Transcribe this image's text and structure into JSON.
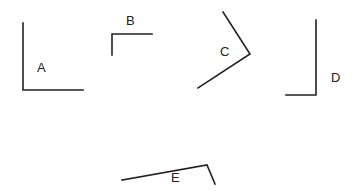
{
  "diagram": {
    "title": "",
    "line_color": "#222222",
    "background": "#ffffff",
    "angles": [
      {
        "label": "A",
        "vertex": [
          23,
          90
        ],
        "ray1_end": [
          23,
          23
        ],
        "ray2_end": [
          83,
          90
        ],
        "label_pos": [
          37,
          72
        ],
        "description": "right angle, rays up and right"
      },
      {
        "label": "B",
        "vertex": [
          112,
          34
        ],
        "ray1_end": [
          112,
          55
        ],
        "ray2_end": [
          152,
          34
        ],
        "label_pos": [
          126,
          25
        ],
        "description": "right angle, rays down and right"
      },
      {
        "label": "C",
        "vertex": [
          250,
          54
        ],
        "ray1_end": [
          223,
          12
        ],
        "ray2_end": [
          198,
          88
        ],
        "label_pos": [
          220,
          56
        ],
        "description": "obtuse-ish angle opening left"
      },
      {
        "label": "D",
        "vertex": [
          316,
          95
        ],
        "ray1_end": [
          316,
          20
        ],
        "ray2_end": [
          286,
          95
        ],
        "label_pos": [
          331,
          82
        ],
        "description": "right angle, rays up and left"
      },
      {
        "label": "E",
        "vertex": [
          207,
          165
        ],
        "ray1_end": [
          122,
          180
        ],
        "ray2_end": [
          215,
          184
        ],
        "label_pos": [
          171,
          182
        ],
        "description": "acute angle opening down-left"
      }
    ]
  }
}
